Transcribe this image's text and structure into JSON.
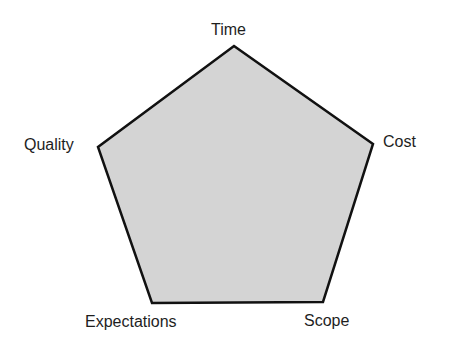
{
  "diagram": {
    "type": "pentagon-constraints",
    "fill_color": "#d4d4d4",
    "stroke_color": "#111111",
    "vertices": [
      {
        "id": "time",
        "label": "Time"
      },
      {
        "id": "cost",
        "label": "Cost"
      },
      {
        "id": "scope",
        "label": "Scope"
      },
      {
        "id": "expectations",
        "label": "Expectations"
      },
      {
        "id": "quality",
        "label": "Quality"
      }
    ]
  }
}
